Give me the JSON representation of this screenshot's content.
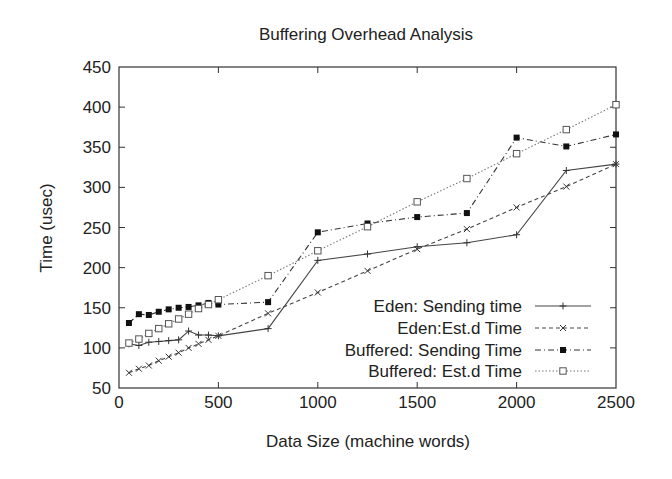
{
  "chart_data": {
    "type": "line",
    "title": "Buffering Overhead Analysis",
    "xlabel": "Data Size (machine words)",
    "ylabel": "Time (usec)",
    "xlim": [
      0,
      2500
    ],
    "ylim": [
      50,
      450
    ],
    "xticks": [
      0,
      500,
      1000,
      1500,
      2000,
      2500
    ],
    "yticks": [
      50,
      100,
      150,
      200,
      250,
      300,
      350,
      400,
      450
    ],
    "grid": false,
    "legend_position": "lower right (inside)",
    "x": [
      50,
      100,
      150,
      200,
      250,
      300,
      350,
      400,
      450,
      500,
      750,
      1000,
      1250,
      1500,
      1750,
      2000,
      2250,
      2500
    ],
    "series": [
      {
        "name": "Eden: Sending time",
        "marker": "plus",
        "line": "solid",
        "values": [
          105,
          103,
          107,
          108,
          109,
          110,
          121,
          116,
          116,
          115,
          124,
          209,
          217,
          226,
          231,
          241,
          321,
          329
        ]
      },
      {
        "name": "Eden:Est.d Time",
        "marker": "x",
        "line": "dashed",
        "values": [
          69,
          74,
          78,
          84,
          89,
          94,
          100,
          105,
          110,
          115,
          143,
          169,
          196,
          223,
          248,
          275,
          301,
          329
        ]
      },
      {
        "name": "Buffered: Sending Time",
        "marker": "filled-square",
        "line": "dash-dot",
        "values": [
          131,
          142,
          141,
          145,
          148,
          150,
          151,
          153,
          156,
          154,
          157,
          244,
          255,
          263,
          268,
          362,
          351,
          366
        ]
      },
      {
        "name": "Buffered: Est.d Time",
        "marker": "open-square",
        "line": "dotted",
        "values": [
          106,
          111,
          118,
          124,
          130,
          136,
          142,
          149,
          154,
          160,
          190,
          221,
          251,
          282,
          311,
          342,
          372,
          403
        ]
      }
    ]
  }
}
